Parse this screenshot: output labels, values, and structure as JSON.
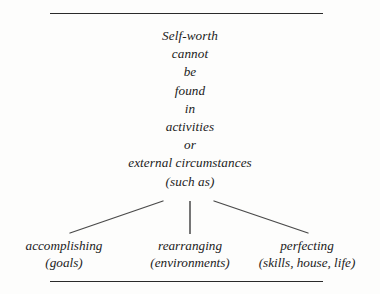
{
  "figure": {
    "name": "self-worth-concept-diagram",
    "background_color": "#fdfdfc",
    "ink_color": "#1b1b1b",
    "rule_color": "#2a2a2a"
  },
  "stanza": {
    "lines": [
      "Self-worth",
      "cannot",
      "be",
      "found",
      "in",
      "activities",
      "or",
      "external circumstances",
      "(such as)"
    ]
  },
  "branches": [
    {
      "head": "accomplishing",
      "sub": "(goals)"
    },
    {
      "head": "rearranging",
      "sub": "(environments)"
    },
    {
      "head": "perfecting",
      "sub": "(skills, house, life)"
    }
  ],
  "connectors": {
    "left_line": {
      "x1": 163,
      "y1": 201,
      "x2": 70,
      "y2": 233,
      "color": "#4a4a4a"
    },
    "center_line": {
      "x1": 190,
      "y1": 201,
      "x2": 190,
      "y2": 234,
      "color": "#6f6f6f"
    },
    "right_line": {
      "x1": 214,
      "y1": 201,
      "x2": 308,
      "y2": 233,
      "color": "#4a4a4a"
    }
  }
}
